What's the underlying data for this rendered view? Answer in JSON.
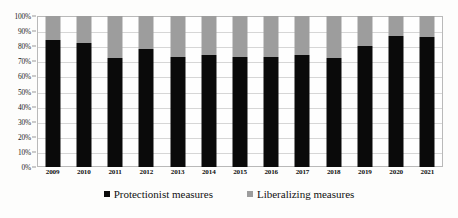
{
  "chart_data": {
    "type": "bar",
    "subtype": "stacked-100-percent",
    "title": "",
    "subtitle": "",
    "xlabel": "",
    "ylabel": "",
    "ylim": [
      0,
      100
    ],
    "grid": true,
    "legend_position": "bottom",
    "categories": [
      "2009",
      "2010",
      "2011",
      "2012",
      "2013",
      "2014",
      "2015",
      "2016",
      "2017",
      "2018",
      "2019",
      "2020",
      "2021"
    ],
    "ytick_labels": [
      "0%",
      "10%",
      "20%",
      "30%",
      "40%",
      "50%",
      "60%",
      "70%",
      "80%",
      "90%",
      "100%"
    ],
    "ytick_values": [
      0,
      10,
      20,
      30,
      40,
      50,
      60,
      70,
      80,
      90,
      100
    ],
    "series": [
      {
        "name": "Protectionist measures",
        "color": "#0a0a0a",
        "values": [
          84,
          82,
          72,
          78,
          73,
          74,
          73,
          73,
          74,
          72,
          80,
          87,
          86
        ]
      },
      {
        "name": "Liberalizing measures",
        "color": "#9d9d9d",
        "values": [
          16,
          18,
          28,
          22,
          27,
          26,
          27,
          27,
          26,
          28,
          20,
          13,
          14
        ]
      }
    ],
    "annotations": []
  },
  "legend": {
    "items": [
      {
        "label": "Protectionist measures",
        "color": "#0a0a0a"
      },
      {
        "label": "Liberalizing measures",
        "color": "#9d9d9d"
      }
    ]
  }
}
